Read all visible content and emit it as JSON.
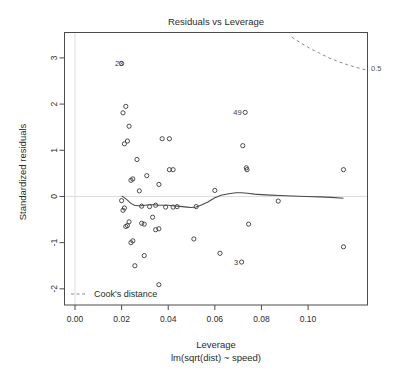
{
  "chart_data": {
    "type": "scatter",
    "title": "Residuals vs Leverage",
    "xlabel": "Leverage",
    "sublabel": "lm(sqrt(dist) ~ speed)",
    "ylabel": "Standardized residuals",
    "xlim": [
      -0.0045,
      0.1255
    ],
    "ylim": [
      -2.35,
      3.55
    ],
    "grid": false,
    "xticks": [
      0.0,
      0.02,
      0.04,
      0.06,
      0.08,
      0.1
    ],
    "xtick_labels": [
      "0.00",
      "0.02",
      "0.04",
      "0.06",
      "0.08",
      "0.10"
    ],
    "yticks": [
      -2,
      -1,
      0,
      1,
      2,
      3
    ],
    "ytick_labels": [
      "-2",
      "-1",
      "0",
      "1",
      "2",
      "3"
    ],
    "zero_reference_line": 0,
    "legend": {
      "position": "bottom-left",
      "entries": [
        "Cook's distance"
      ]
    },
    "annotations": [
      {
        "text": "0.5",
        "x": 0.1255,
        "y": 2.75,
        "note": "Cook's distance contour label at right edge"
      }
    ],
    "x": [
      0.02,
      0.0206,
      0.0212,
      0.0218,
      0.0225,
      0.0232,
      0.024,
      0.0248,
      0.02,
      0.0206,
      0.0212,
      0.0218,
      0.0225,
      0.0232,
      0.024,
      0.0248,
      0.0257,
      0.0266,
      0.0276,
      0.0286,
      0.0286,
      0.0297,
      0.0297,
      0.0308,
      0.032,
      0.0333,
      0.0346,
      0.0346,
      0.036,
      0.036,
      0.036,
      0.0374,
      0.0389,
      0.0405,
      0.0405,
      0.0421,
      0.0421,
      0.0438,
      0.051,
      0.052,
      0.06,
      0.0622,
      0.0715,
      0.072,
      0.073,
      0.0735,
      0.0738,
      0.0745,
      0.0872,
      0.1152,
      0.1152
    ],
    "y": [
      2.88,
      1.81,
      1.14,
      1.95,
      1.2,
      1.52,
      0.35,
      0.38,
      -0.09,
      -0.3,
      -0.25,
      -0.65,
      -0.63,
      -0.55,
      -1.0,
      -0.96,
      -1.5,
      0.8,
      0.12,
      -0.21,
      -0.58,
      -0.6,
      -1.28,
      0.45,
      -0.22,
      -0.45,
      -0.19,
      -0.72,
      -0.7,
      -1.91,
      0.26,
      1.25,
      -0.23,
      0.58,
      1.25,
      -0.23,
      0.58,
      -0.22,
      -0.92,
      -0.22,
      0.13,
      -1.23,
      -1.42,
      1.1,
      1.82,
      0.62,
      0.58,
      -0.6,
      -0.1,
      0.58,
      -1.09
    ],
    "labeled_points": [
      {
        "label": "23",
        "x": 0.0222,
        "y": 2.88
      },
      {
        "label": "49",
        "x": 0.073,
        "y": 1.82
      },
      {
        "label": "3",
        "x": 0.0715,
        "y": -1.42
      }
    ],
    "loess_series": {
      "name": "loess smoother",
      "x": [
        0.02,
        0.021,
        0.0225,
        0.024,
        0.0255,
        0.027,
        0.0285,
        0.03,
        0.032,
        0.034,
        0.036,
        0.038,
        0.04,
        0.042,
        0.044,
        0.046,
        0.048,
        0.05,
        0.052,
        0.0545,
        0.057,
        0.06,
        0.063,
        0.066,
        0.069,
        0.0715,
        0.074,
        0.077,
        0.08,
        0.084,
        0.088,
        0.093,
        0.099,
        0.105,
        0.11,
        0.1152
      ],
      "y": [
        0.01,
        -0.02,
        -0.08,
        -0.15,
        -0.19,
        -0.2,
        -0.2,
        -0.19,
        -0.18,
        -0.18,
        -0.19,
        -0.19,
        -0.19,
        -0.2,
        -0.21,
        -0.22,
        -0.23,
        -0.24,
        -0.23,
        -0.18,
        -0.12,
        -0.03,
        0.03,
        0.06,
        0.08,
        0.08,
        0.07,
        0.05,
        0.04,
        0.03,
        0.02,
        0.01,
        0.0,
        -0.01,
        -0.02,
        -0.04
      ]
    },
    "cook_contour": {
      "name": "Cook's distance 0.5",
      "x": [
        0.0895,
        0.093,
        0.097,
        0.101,
        0.105,
        0.109,
        0.113,
        0.117,
        0.121,
        0.1255
      ],
      "y": [
        3.58,
        3.45,
        3.32,
        3.2,
        3.1,
        3.0,
        2.92,
        2.85,
        2.79,
        2.73
      ]
    },
    "colors": {
      "point_stroke": "#3a3a3a",
      "loess_stroke": "#4a4a4a",
      "cook_stroke": "#8a8a8a",
      "axis": "#4a4a4a",
      "zero_line": "#dcdcdc",
      "background": "#ffffff",
      "text": "#2b2b2b"
    }
  }
}
